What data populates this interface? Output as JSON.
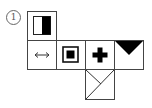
{
  "figure": {
    "label": "1",
    "type": "cube-net",
    "line_color": "#444444",
    "fill_color": "#000000",
    "faces": [
      {
        "id": "top",
        "row": 0,
        "col": 0,
        "symbol": "half-black-rectangle"
      },
      {
        "id": "middle-1",
        "row": 1,
        "col": 0,
        "symbol": "double-arrow",
        "glyph": "↔"
      },
      {
        "id": "middle-2",
        "row": 1,
        "col": 1,
        "symbol": "square-in-square"
      },
      {
        "id": "middle-3",
        "row": 1,
        "col": 2,
        "symbol": "plus"
      },
      {
        "id": "middle-4",
        "row": 1,
        "col": 3,
        "symbol": "downward-triangle"
      },
      {
        "id": "bottom",
        "row": 2,
        "col": 2,
        "symbol": "diagonal-lines"
      }
    ]
  }
}
